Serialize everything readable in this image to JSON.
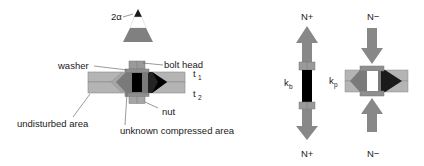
{
  "diagram": {
    "left_panel": {
      "cone_angle_label": "2α",
      "labels": {
        "washer": "washer",
        "bolt_head": "bolt head",
        "t1": "t",
        "t1_sub": "1",
        "t2": "t",
        "t2_sub": "2",
        "undisturbed_area": "undisturbed area",
        "nut": "nut",
        "unknown_compressed_area": "unknown compressed area"
      }
    },
    "bolt_model": {
      "top_label": "N+",
      "bottom_label": "N+",
      "stiffness_label": "k",
      "stiffness_sub": "b"
    },
    "plate_model": {
      "top_label": "N−",
      "bottom_label": "N−",
      "stiffness_label": "k",
      "stiffness_sub": "p"
    },
    "colors": {
      "plate": "#b4b4b4",
      "plate_edge": "#8a8a8a",
      "cone": "#7a7a7a",
      "cone_dark": "#5a5a5a",
      "bolt": "#000000",
      "arrow": "#888888",
      "washer": "#9a9a9a",
      "leader": "#555555"
    }
  }
}
